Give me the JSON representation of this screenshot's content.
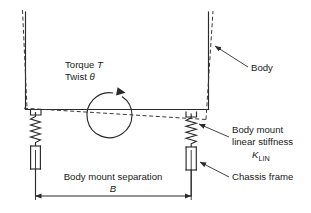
{
  "diagram": {
    "background_color": "#ffffff",
    "line_color": "#2b2b2b",
    "labels": {
      "torque": "Torque",
      "torque_symbol": "T",
      "twist": "Twist",
      "twist_symbol": "θ",
      "body": "Body",
      "body_mount_line1": "Body mount",
      "body_mount_line2": "linear stiffness",
      "stiffness_symbol": "K",
      "stiffness_subscript": "LIN",
      "chassis_frame": "Chassis frame",
      "separation": "Body mount separation",
      "separation_symbol": "B"
    },
    "elements": {
      "body_outline": "solid rectangle open at top representing undeformed vehicle body",
      "deformed_outline": "dashed outline representing twisted body position",
      "left_spring": "coil spring at left body mount",
      "right_spring": "coil spring at right body mount",
      "torque_arrow": "clockwise circular arrow at body center",
      "dimension_arrow": "double headed horizontal dimension arrow"
    }
  }
}
